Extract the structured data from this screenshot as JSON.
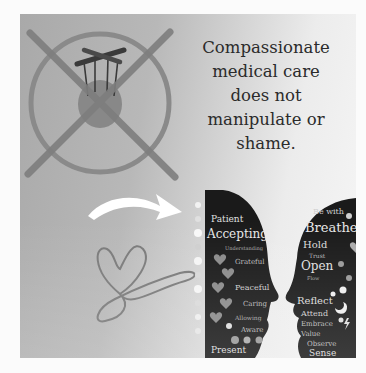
{
  "message": {
    "lines": [
      "Compassionate",
      "medical care",
      "does not",
      "manipulate or",
      "shame."
    ]
  },
  "illustration": {
    "prohibition_sign": "no-manipulation-sign",
    "arrow": "curved-arrow-right",
    "heart": "heart-infinity-loop",
    "heads": "two-facing-heads-word-cloud"
  },
  "left_head_words": [
    "Patient",
    "Accepting",
    "Understanding",
    "Grateful",
    "Peaceful",
    "Caring",
    "Allowing",
    "Aware",
    "Present"
  ],
  "right_head_words": [
    "Be with",
    "Breathe",
    "Hold",
    "Trust",
    "Open",
    "Flow",
    "Reflect",
    "Attend",
    "Embrace",
    "Value",
    "Observe",
    "Sense"
  ],
  "colors": {
    "page_bg": "#fbfbfb",
    "panel_dark": "#a9a9a9",
    "panel_light": "#f6f6f6",
    "sign_stroke": "#868686",
    "text": "#2b2b2b",
    "head_fill": "#1a1a1a"
  }
}
